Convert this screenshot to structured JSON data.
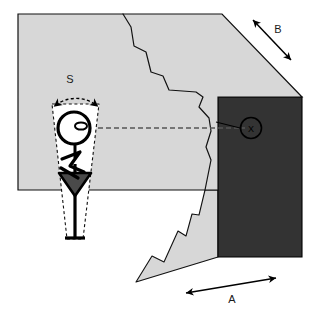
{
  "figure": {
    "canvas": {
      "width": 319,
      "height": 312,
      "background": "#ffffff"
    },
    "colors": {
      "block_fill": "#d7d7d7",
      "shadow_fill": "#333333",
      "cone_fill": "#ffffff",
      "outline": "#000000",
      "dashed_line": "#555555",
      "label_text": "#1a1a1a"
    },
    "labels": {
      "s": "S",
      "a": "A",
      "b": "B",
      "x": "X"
    },
    "annotations": [
      {
        "name": "arc-dimension-s",
        "label": "S",
        "kind": "double-headed-arc-arrow",
        "description": "Dashed arc spanning the top of the viewing cone with arrowheads at both ends"
      },
      {
        "name": "arrow-dimension-a",
        "label": "A",
        "kind": "double-headed-straight-arrow",
        "description": "Horizontal double arrow below the lower block edge"
      },
      {
        "name": "arrow-dimension-b",
        "label": "B",
        "kind": "double-headed-straight-arrow",
        "description": "Diagonal double arrow parallel to the upper right bevel edge"
      },
      {
        "name": "point-marker-x",
        "label": "X",
        "kind": "circled-letter",
        "description": "Circled X target point on the dark face, connected by a leader line"
      },
      {
        "name": "sight-line",
        "label": "",
        "kind": "dashed-line",
        "description": "Horizontal dashed line of sight from the observer's head to point X"
      }
    ],
    "shapes": [
      {
        "name": "main-block",
        "fill": "#d7d7d7",
        "description": "Large light gray slab with beveled top-right corner"
      },
      {
        "name": "dark-face",
        "fill": "#333333",
        "description": "Dark right-hand face of the block"
      },
      {
        "name": "lower-wedge",
        "fill": "#d7d7d7",
        "description": "Light gray wedge below the slab with jagged left edge"
      },
      {
        "name": "fracture-crack",
        "fill": "none",
        "description": "Jagged vertical crack running through the block"
      },
      {
        "name": "viewing-cone",
        "fill": "#ffffff",
        "description": "White dashed-outline cone representing the observer field of view"
      },
      {
        "name": "observer-figure",
        "fill": "#000000",
        "description": "Top-down stick figure of a person with head, arms and dark triangular base"
      }
    ]
  }
}
